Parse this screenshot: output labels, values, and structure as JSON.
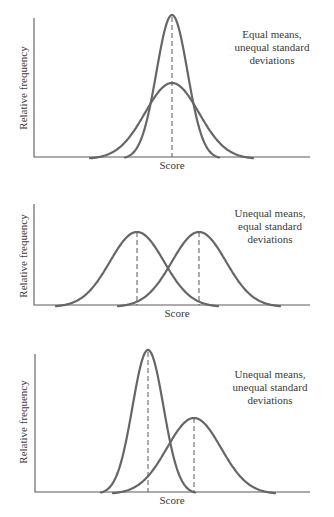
{
  "chart_data": [
    {
      "type": "line",
      "title": "Equal means, unequal standard deviations",
      "annotation": [
        "Equal means,",
        "unequal standard",
        "deviations"
      ],
      "xlabel": "Score",
      "ylabel": "Relative frequency",
      "grid": false,
      "series": [
        {
          "name": "narrow",
          "mean": 0,
          "sd": 0.6,
          "relative_peak": 1.0,
          "mean_line": "dashed"
        },
        {
          "name": "wide",
          "mean": 0,
          "sd": 1.0,
          "relative_peak": 0.52
        }
      ],
      "layout": {
        "axis_x": [
          34,
          310
        ],
        "axis_top": 18,
        "baseline": 157,
        "sd_px": {
          "narrow": 15.5,
          "wide": 27
        },
        "mean_px": [
          172,
          172
        ],
        "peak_y": [
          15,
          83
        ]
      }
    },
    {
      "type": "line",
      "title": "Unequal means, equal standard deviations",
      "annotation": [
        "Unequal means,",
        "equal standard",
        "deviations"
      ],
      "xlabel": "Score",
      "ylabel": "Relative frequency",
      "grid": false,
      "series": [
        {
          "name": "left",
          "mean": -1,
          "sd": 1.0,
          "relative_peak": 1.0,
          "mean_line": "dashed"
        },
        {
          "name": "right",
          "mean": 1,
          "sd": 1.0,
          "relative_peak": 1.0,
          "mean_line": "dashed"
        }
      ],
      "layout": {
        "axis_x": [
          34,
          310
        ],
        "axis_top": 204,
        "baseline": 305,
        "sd_px": {
          "left": 27,
          "right": 27
        },
        "mean_px": [
          137,
          199
        ],
        "peak_y": [
          232,
          232
        ]
      }
    },
    {
      "type": "line",
      "title": "Unequal means, unequal standard deviations",
      "annotation": [
        "Unequal means,",
        "unequal standard",
        "deviations"
      ],
      "xlabel": "Score",
      "ylabel": "Relative frequency",
      "grid": false,
      "series": [
        {
          "name": "narrow",
          "mean": -0.85,
          "sd": 0.58,
          "relative_peak": 1.0,
          "mean_line": "dashed"
        },
        {
          "name": "wide",
          "mean": 0.85,
          "sd": 1.0,
          "relative_peak": 0.53,
          "mean_line": "dashed"
        }
      ],
      "layout": {
        "axis_x": [
          35,
          310
        ],
        "axis_top": 350,
        "baseline": 492,
        "sd_px": {
          "narrow": 15.5,
          "wide": 27
        },
        "mean_px": [
          148,
          194
        ],
        "peak_y": [
          350,
          418
        ]
      }
    }
  ],
  "panels": [
    {
      "ylabel": "Relative frequency",
      "xlabel": "Score",
      "note": [
        "Equal means,",
        "unequal standard",
        "deviations"
      ]
    },
    {
      "ylabel": "Relative frequency",
      "xlabel": "Score",
      "note": [
        "Unequal means,",
        "equal standard",
        "deviations"
      ]
    },
    {
      "ylabel": "Relative frequency",
      "xlabel": "Score",
      "note": [
        "Unequal means,",
        "unequal standard",
        "deviations"
      ]
    }
  ]
}
